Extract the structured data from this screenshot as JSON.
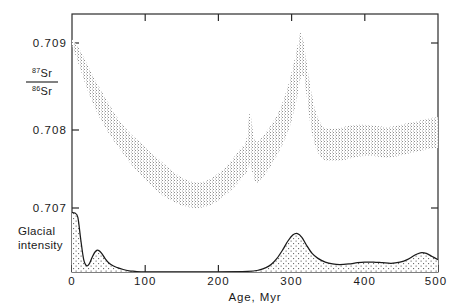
{
  "figure": {
    "background_color": "#ffffff",
    "line_color": "#1a1a1a",
    "stipple_color": "#8a8a8a"
  },
  "axes": {
    "x_label": "Age, Myr",
    "x_ticks": [
      "0",
      "100",
      "200",
      "300",
      "400",
      "500"
    ],
    "y_ticks": [
      "0.709",
      "0.708",
      "0.707"
    ],
    "y_label_numerator_sup": "87",
    "y_label_numerator_el": "Sr",
    "y_label_denominator_sup": "86",
    "y_label_denominator_el": "Sr"
  },
  "secondary_axis": {
    "label_line1": "Glacial",
    "label_line2": "intensity",
    "baseline_tick": "0"
  },
  "chart_data": {
    "type": "area",
    "title": "",
    "xlabel": "Age, Myr",
    "ylabel": "87Sr/86Sr",
    "xlim": [
      0,
      500
    ],
    "ylim": [
      0.70695,
      0.70935
    ],
    "grid": false,
    "legend": "none",
    "series": [
      {
        "name": "Seawater 87Sr/86Sr envelope (upper bound)",
        "kind": "band-upper",
        "x": [
          0,
          10,
          20,
          30,
          40,
          50,
          60,
          70,
          80,
          90,
          100,
          110,
          120,
          130,
          140,
          150,
          160,
          170,
          180,
          190,
          200,
          210,
          220,
          230,
          238,
          243,
          248,
          252,
          258,
          265,
          275,
          285,
          295,
          302,
          308,
          312,
          316,
          320,
          326,
          332,
          338,
          342,
          346,
          350,
          360,
          370,
          380,
          390,
          400,
          410,
          420,
          430,
          440,
          450,
          460,
          470,
          480,
          490,
          500
        ],
        "y": [
          0.70905,
          0.70893,
          0.70876,
          0.70858,
          0.70842,
          0.70827,
          0.70812,
          0.708,
          0.7079,
          0.70782,
          0.70774,
          0.70766,
          0.70758,
          0.7075,
          0.70743,
          0.70737,
          0.70733,
          0.70731,
          0.70732,
          0.70736,
          0.70742,
          0.7075,
          0.7076,
          0.70772,
          0.70782,
          0.70816,
          0.70789,
          0.7078,
          0.70784,
          0.70792,
          0.70805,
          0.70822,
          0.70848,
          0.70872,
          0.70896,
          0.70912,
          0.70903,
          0.7088,
          0.70846,
          0.7082,
          0.70806,
          0.708,
          0.70797,
          0.70796,
          0.70796,
          0.70798,
          0.708,
          0.70801,
          0.70801,
          0.708,
          0.70799,
          0.70798,
          0.70799,
          0.70801,
          0.70803,
          0.70805,
          0.70807,
          0.70809,
          0.7081
        ]
      },
      {
        "name": "Seawater 87Sr/86Sr envelope (lower bound)",
        "kind": "band-lower",
        "x": [
          0,
          10,
          20,
          30,
          40,
          50,
          60,
          70,
          80,
          90,
          100,
          110,
          120,
          130,
          140,
          150,
          160,
          170,
          180,
          190,
          200,
          210,
          220,
          230,
          238,
          243,
          248,
          252,
          258,
          265,
          275,
          285,
          295,
          302,
          308,
          312,
          316,
          320,
          326,
          332,
          338,
          342,
          346,
          350,
          360,
          370,
          380,
          390,
          400,
          410,
          420,
          430,
          440,
          450,
          460,
          470,
          480,
          490,
          500
        ],
        "y": [
          0.70898,
          0.70872,
          0.70846,
          0.70824,
          0.70806,
          0.70791,
          0.70778,
          0.70766,
          0.70754,
          0.70744,
          0.70734,
          0.70726,
          0.70718,
          0.70712,
          0.70707,
          0.70703,
          0.70701,
          0.707,
          0.70701,
          0.70704,
          0.70709,
          0.70716,
          0.70724,
          0.70734,
          0.70742,
          0.70752,
          0.70738,
          0.7073,
          0.70734,
          0.70742,
          0.70756,
          0.70772,
          0.70792,
          0.70812,
          0.70836,
          0.70856,
          0.7086,
          0.7084,
          0.708,
          0.70776,
          0.70764,
          0.7076,
          0.70758,
          0.70757,
          0.70757,
          0.70758,
          0.7076,
          0.70762,
          0.70763,
          0.70763,
          0.70762,
          0.70761,
          0.70762,
          0.70764,
          0.70766,
          0.70768,
          0.7077,
          0.70772,
          0.70773
        ]
      },
      {
        "name": "Glacial intensity",
        "kind": "area",
        "x": [
          0,
          4,
          8,
          12,
          16,
          20,
          24,
          28,
          32,
          36,
          40,
          45,
          50,
          56,
          62,
          70,
          78,
          86,
          94,
          100,
          150,
          200,
          240,
          255,
          265,
          272,
          280,
          288,
          295,
          302,
          308,
          314,
          320,
          328,
          336,
          346,
          356,
          366,
          378,
          390,
          400,
          412,
          424,
          436,
          448,
          458,
          468,
          476,
          484,
          492,
          500
        ],
        "y": [
          0.96,
          0.95,
          0.88,
          0.52,
          0.2,
          0.1,
          0.14,
          0.25,
          0.33,
          0.35,
          0.31,
          0.22,
          0.15,
          0.1,
          0.07,
          0.04,
          0.02,
          0.01,
          0.0,
          0.0,
          0.0,
          0.0,
          0.01,
          0.03,
          0.07,
          0.12,
          0.22,
          0.36,
          0.5,
          0.6,
          0.62,
          0.56,
          0.44,
          0.3,
          0.22,
          0.16,
          0.13,
          0.12,
          0.13,
          0.15,
          0.16,
          0.16,
          0.15,
          0.14,
          0.16,
          0.2,
          0.27,
          0.31,
          0.3,
          0.25,
          0.2
        ],
        "units": "relative intensity (unitless)",
        "peaks_myr": [
          0,
          36,
          308,
          476
        ]
      }
    ],
    "annotations": [
      {
        "text": "Glacial intensity",
        "x_myr": 0,
        "note": "label left of secondary baseline"
      }
    ]
  }
}
